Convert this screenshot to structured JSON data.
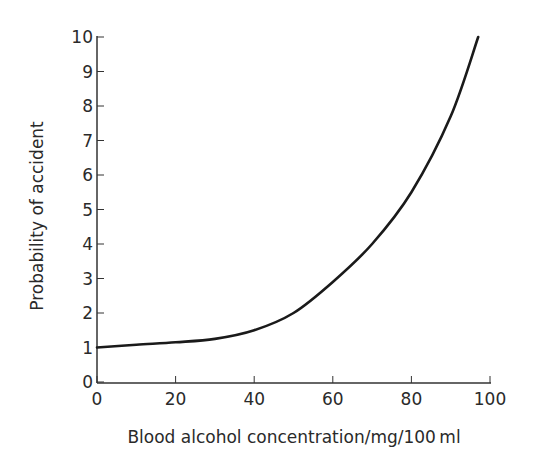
{
  "chart_data": {
    "type": "line",
    "title": "",
    "xlabel": "Blood alcohol concentration/mg/100 ml",
    "ylabel": "Probability of accident",
    "xlim": [
      0,
      100
    ],
    "ylim": [
      0,
      10
    ],
    "x_ticks": [
      0,
      20,
      40,
      60,
      80,
      100
    ],
    "y_ticks": [
      0,
      1,
      2,
      3,
      4,
      5,
      6,
      7,
      8,
      9,
      10
    ],
    "grid": false,
    "legend": null,
    "series": [
      {
        "name": "Probability of accident",
        "x": [
          0,
          10,
          20,
          30,
          40,
          50,
          60,
          70,
          80,
          90,
          97
        ],
        "y": [
          1.0,
          1.08,
          1.15,
          1.25,
          1.5,
          2.0,
          2.9,
          4.0,
          5.5,
          7.7,
          10.0
        ],
        "color": "#1a1a1a"
      }
    ]
  }
}
